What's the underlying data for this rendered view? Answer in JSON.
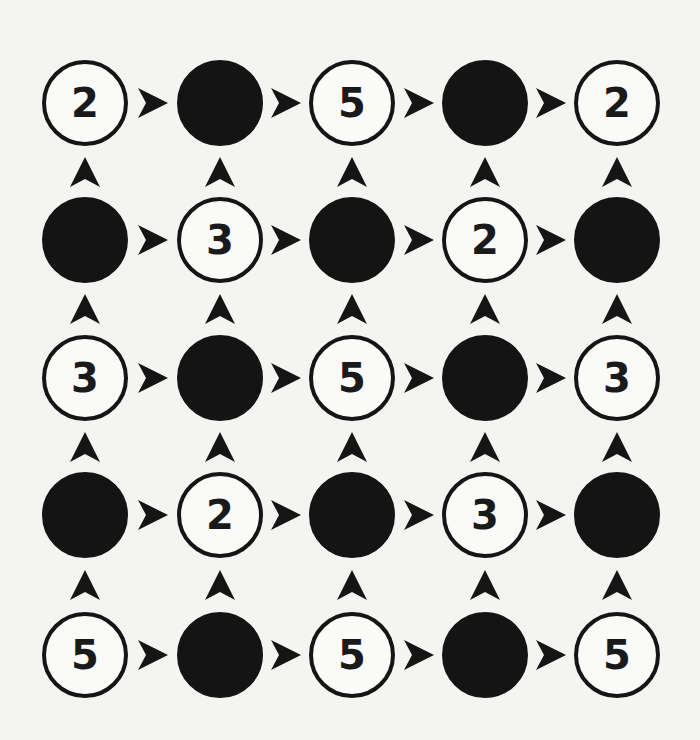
{
  "puzzle": {
    "rows": 5,
    "cols": 5,
    "colors": {
      "fill_black": "#141414",
      "fill_white": "#fafaf8",
      "stroke": "#151515",
      "background": "#f4f4f2"
    },
    "grid": [
      [
        {
          "type": "white",
          "value": "2"
        },
        {
          "type": "black",
          "value": ""
        },
        {
          "type": "white",
          "value": "5"
        },
        {
          "type": "black",
          "value": ""
        },
        {
          "type": "white",
          "value": "2"
        }
      ],
      [
        {
          "type": "black",
          "value": ""
        },
        {
          "type": "white",
          "value": "3"
        },
        {
          "type": "black",
          "value": ""
        },
        {
          "type": "white",
          "value": "2"
        },
        {
          "type": "black",
          "value": ""
        }
      ],
      [
        {
          "type": "white",
          "value": "3"
        },
        {
          "type": "black",
          "value": ""
        },
        {
          "type": "white",
          "value": "5"
        },
        {
          "type": "black",
          "value": ""
        },
        {
          "type": "white",
          "value": "3"
        }
      ],
      [
        {
          "type": "black",
          "value": ""
        },
        {
          "type": "white",
          "value": "2"
        },
        {
          "type": "black",
          "value": ""
        },
        {
          "type": "white",
          "value": "3"
        },
        {
          "type": "black",
          "value": ""
        }
      ],
      [
        {
          "type": "white",
          "value": "5"
        },
        {
          "type": "black",
          "value": ""
        },
        {
          "type": "white",
          "value": "5"
        },
        {
          "type": "black",
          "value": ""
        },
        {
          "type": "white",
          "value": "5"
        }
      ]
    ],
    "horizontal_arrows": "right",
    "vertical_arrows": "up",
    "layout": {
      "col_centers": [
        85,
        220,
        352,
        485,
        617
      ],
      "row_centers": [
        103,
        240,
        378,
        515,
        655
      ]
    }
  }
}
